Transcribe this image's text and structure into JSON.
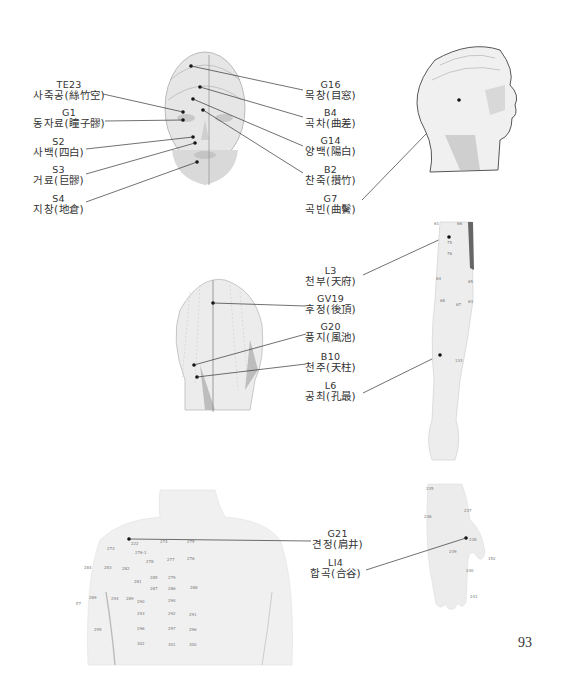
{
  "page": {
    "number": "93"
  },
  "figures": {
    "face_front": {
      "labels": [
        {
          "code": "TE23",
          "name": "사죽공(絲竹空)"
        },
        {
          "code": "G1",
          "name": "동자료(瞳子髎)"
        },
        {
          "code": "S2",
          "name": "사백(四白)"
        },
        {
          "code": "S3",
          "name": "거료(巨髎)"
        },
        {
          "code": "S4",
          "name": "지창(地倉)"
        },
        {
          "code": "G16",
          "name": "목창(目窓)"
        },
        {
          "code": "B4",
          "name": "곡차(曲差)"
        },
        {
          "code": "G14",
          "name": "양백(陽白)"
        },
        {
          "code": "B2",
          "name": "찬죽(攢竹)"
        },
        {
          "code": "G7",
          "name": "곡빈(曲鬢)"
        }
      ]
    },
    "head_back": {
      "labels": [
        {
          "code": "GV19",
          "name": "후정(後頂)"
        },
        {
          "code": "G20",
          "name": "풍지(風池)"
        },
        {
          "code": "B10",
          "name": "천주(天柱)"
        }
      ]
    },
    "arm": {
      "labels": [
        {
          "code": "L3",
          "name": "천부(天府)"
        },
        {
          "code": "L6",
          "name": "공최(孔最)"
        }
      ],
      "point_numbers": [
        "61",
        "66",
        "75",
        "76",
        "64",
        "65",
        "68",
        "67",
        "63",
        "133"
      ]
    },
    "back": {
      "labels": [
        {
          "code": "G21",
          "name": "견정(肩井)"
        }
      ],
      "point_numbers": [
        "222",
        "274",
        "275",
        "273",
        "276-1",
        "278",
        "277",
        "276",
        "284",
        "283",
        "282",
        "281",
        "285",
        "279",
        "287",
        "286",
        "288",
        "289",
        "294",
        "290",
        "293",
        "292",
        "291",
        "295",
        "297",
        "296",
        "302",
        "301",
        "300",
        "E7"
      ]
    },
    "hand": {
      "labels": [
        {
          "code": "LI4",
          "name": "합곡(合谷)"
        }
      ],
      "point_numbers": [
        "235",
        "236",
        "237",
        "238",
        "239",
        "240",
        "241",
        "152"
      ]
    }
  }
}
